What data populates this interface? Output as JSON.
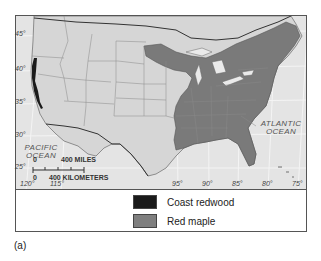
{
  "figure": {
    "caption": "(a)",
    "map": {
      "latitude_labels": [
        {
          "label": "45°",
          "top": 30
        },
        {
          "label": "40°",
          "top": 65
        },
        {
          "label": "35°",
          "top": 98
        },
        {
          "label": "30°",
          "top": 131
        },
        {
          "label": "25°",
          "top": 163
        }
      ],
      "longitude_labels": [
        {
          "label": "120°",
          "left": 20
        },
        {
          "label": "115°",
          "left": 50
        },
        {
          "label": "95°",
          "left": 172
        },
        {
          "label": "90°",
          "left": 202
        },
        {
          "label": "85°",
          "left": 232
        },
        {
          "label": "80°",
          "left": 262
        },
        {
          "label": "75°",
          "left": 292
        }
      ],
      "oceans": {
        "pacific": "PACIFIC\nOCEAN",
        "atlantic": "ATLANTIC\nOCEAN"
      },
      "scale_bar": {
        "miles_zero": "0",
        "miles_label": "400 MILES",
        "km_zero": "0",
        "km_label": "400 KILOMETERS"
      },
      "colors": {
        "land": "#d9d9d9",
        "ocean": "#e6e6e6",
        "state_border": "#8a8a8a",
        "coast_redwood": "#1a1a1a",
        "red_maple": "#7a7a7a"
      }
    },
    "legend": {
      "items": [
        {
          "label": "Coast redwood",
          "color": "#1a1a1a"
        },
        {
          "label": "Red maple",
          "color": "#7f7f7f"
        }
      ]
    }
  }
}
